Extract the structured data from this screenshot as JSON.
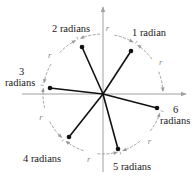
{
  "diagram": {
    "type": "radian-measure-illustration",
    "center": {
      "x": 103,
      "y": 94
    },
    "circle_radius": 60,
    "colors": {
      "axis": "#a0a0a0",
      "circle": "#9a9a9a",
      "ray": "#111111",
      "label": "#1a1a1a",
      "r_label": "#8a8a8a"
    },
    "axes": {
      "x": {
        "from": 22,
        "to": 186
      },
      "y": {
        "from": 172,
        "to": 7
      }
    },
    "rays": [
      {
        "radians": 1,
        "end": {
          "x": 131,
          "y": 51
        }
      },
      {
        "radians": 2,
        "end": {
          "x": 82,
          "y": 47
        }
      },
      {
        "radians": 3,
        "end": {
          "x": 50,
          "y": 88
        }
      },
      {
        "radians": 4,
        "end": {
          "x": 69,
          "y": 137
        }
      },
      {
        "radians": 5,
        "end": {
          "x": 118,
          "y": 149
        }
      },
      {
        "radians": 6,
        "end": {
          "x": 157,
          "y": 108
        }
      }
    ],
    "labels": {
      "one": "1 radian",
      "two": "2 radians",
      "three_num": "3",
      "three_word": "radians",
      "four": "4 radians",
      "five": "5 radians",
      "six_num": "6",
      "six_word": "radians"
    },
    "arc_label": "r"
  }
}
